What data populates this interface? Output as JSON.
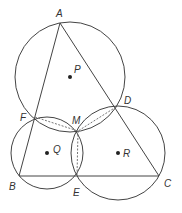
{
  "diagram": {
    "points": {
      "A": {
        "label": "A"
      },
      "B": {
        "label": "B"
      },
      "C": {
        "label": "C"
      },
      "D": {
        "label": "D"
      },
      "E": {
        "label": "E"
      },
      "F": {
        "label": "F"
      },
      "M": {
        "label": "M"
      },
      "P": {
        "label": "P"
      },
      "Q": {
        "label": "Q"
      },
      "R": {
        "label": "R"
      }
    },
    "colors": {
      "stroke": "#444444",
      "dashed": "#666666"
    }
  }
}
